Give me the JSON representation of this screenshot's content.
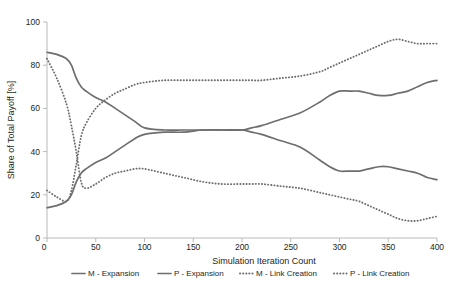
{
  "chart_data": {
    "type": "line",
    "title": "",
    "xlabel": "Simulation Iteration Count",
    "ylabel": "Share of Total Payoff [%]",
    "xlim": [
      0,
      400
    ],
    "ylim": [
      0,
      100
    ],
    "xticks": [
      0,
      50,
      100,
      150,
      200,
      250,
      300,
      350,
      400
    ],
    "xtick_labels": [
      "0",
      "50",
      "100",
      "150",
      "200",
      "250",
      "300",
      "350",
      "400"
    ],
    "yticks": [
      0,
      20,
      40,
      60,
      80,
      100
    ],
    "ytick_labels": [
      "0",
      "20",
      "40",
      "60",
      "80",
      "100"
    ],
    "grid": false,
    "legend_position": "bottom",
    "x": [
      0,
      10,
      20,
      25,
      30,
      35,
      40,
      50,
      60,
      70,
      80,
      90,
      100,
      120,
      140,
      160,
      180,
      200,
      210,
      220,
      240,
      260,
      280,
      290,
      300,
      310,
      320,
      330,
      340,
      350,
      360,
      370,
      380,
      390,
      400
    ],
    "series": [
      {
        "name": "M - Expansion",
        "style": "solid",
        "color": "#6e6e6e",
        "values": [
          86,
          85,
          83,
          80,
          74,
          70,
          68,
          65,
          63,
          60,
          57,
          54,
          51,
          50,
          50,
          50,
          50,
          50,
          49,
          48,
          45,
          42,
          36,
          33,
          31,
          31,
          31,
          32,
          33,
          33,
          32,
          31,
          30,
          28,
          27
        ]
      },
      {
        "name": "P - Expansion",
        "style": "solid",
        "color": "#6e6e6e",
        "values": [
          14,
          15,
          17,
          20,
          26,
          30,
          32,
          35,
          37,
          40,
          43,
          46,
          48,
          49,
          49,
          50,
          50,
          50,
          51,
          52,
          55,
          58,
          63,
          66,
          68,
          68,
          68,
          67,
          66,
          66,
          67,
          68,
          70,
          72,
          73
        ]
      },
      {
        "name": "M - Link Creation",
        "style": "dotted",
        "color": "#6e6e6e",
        "values": [
          83,
          74,
          62,
          52,
          40,
          26,
          23,
          25,
          28,
          30,
          31,
          32,
          32,
          30,
          28,
          26,
          25,
          25,
          25,
          25,
          24,
          23,
          21,
          20,
          19,
          18,
          17,
          15,
          13,
          11,
          9,
          8,
          8,
          9,
          10
        ]
      },
      {
        "name": "P - Link Creation",
        "style": "dotted",
        "color": "#6e6e6e",
        "values": [
          22,
          19,
          17,
          22,
          34,
          47,
          53,
          60,
          64,
          67,
          69,
          71,
          72,
          73,
          73,
          73,
          73,
          73,
          73,
          73,
          74,
          75,
          77,
          79,
          81,
          83,
          85,
          87,
          89,
          91,
          92,
          91,
          90,
          90,
          90
        ]
      }
    ]
  },
  "legend": {
    "items": [
      {
        "label": "M - Expansion",
        "style": "solid"
      },
      {
        "label": "P - Expansion",
        "style": "solid"
      },
      {
        "label": "M - Link Creation",
        "style": "dotted"
      },
      {
        "label": "P - Link Creation",
        "style": "dotted"
      }
    ]
  },
  "colors": {
    "line": "#6e6e6e",
    "axis": "#b9b9b9",
    "text": "#231f20",
    "background": "#ffffff"
  }
}
